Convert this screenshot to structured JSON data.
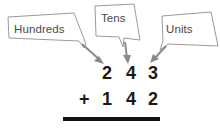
{
  "figure": {
    "background_color": "#ffffff",
    "outline_color": "#9a9a9a",
    "label_text_color": "#4a4a4a",
    "arrow_color": "#8a8a8a",
    "digit_color": "#1a1a1a",
    "rule_color": "#111111"
  },
  "callouts": [
    {
      "id": "hundreds",
      "label": "Hundreds",
      "points_to": "2"
    },
    {
      "id": "tens",
      "label": "Tens",
      "points_to": "4"
    },
    {
      "id": "units",
      "label": "Units",
      "points_to": "3"
    }
  ],
  "sum": {
    "operator": "+",
    "addend_1": {
      "hundreds": "2",
      "tens": "4",
      "units": "3"
    },
    "addend_2": {
      "hundreds": "1",
      "tens": "4",
      "units": "2"
    },
    "rule_visible": true,
    "result": ""
  }
}
